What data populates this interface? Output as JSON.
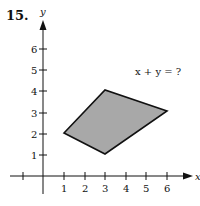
{
  "problem": {
    "number": "15.",
    "question": "x + y = ?"
  },
  "axes": {
    "x_label": "x",
    "y_label": "y",
    "x_ticks": [
      "1",
      "2",
      "3",
      "4",
      "5",
      "6"
    ],
    "y_ticks": [
      "1",
      "2",
      "3",
      "4",
      "5",
      "6"
    ]
  },
  "shape": {
    "type": "quadrilateral",
    "vertices": [
      [
        1,
        2
      ],
      [
        3,
        4
      ],
      [
        6,
        3
      ],
      [
        3,
        1
      ]
    ],
    "fill": "#a8a8a8",
    "stroke": "#111111"
  }
}
